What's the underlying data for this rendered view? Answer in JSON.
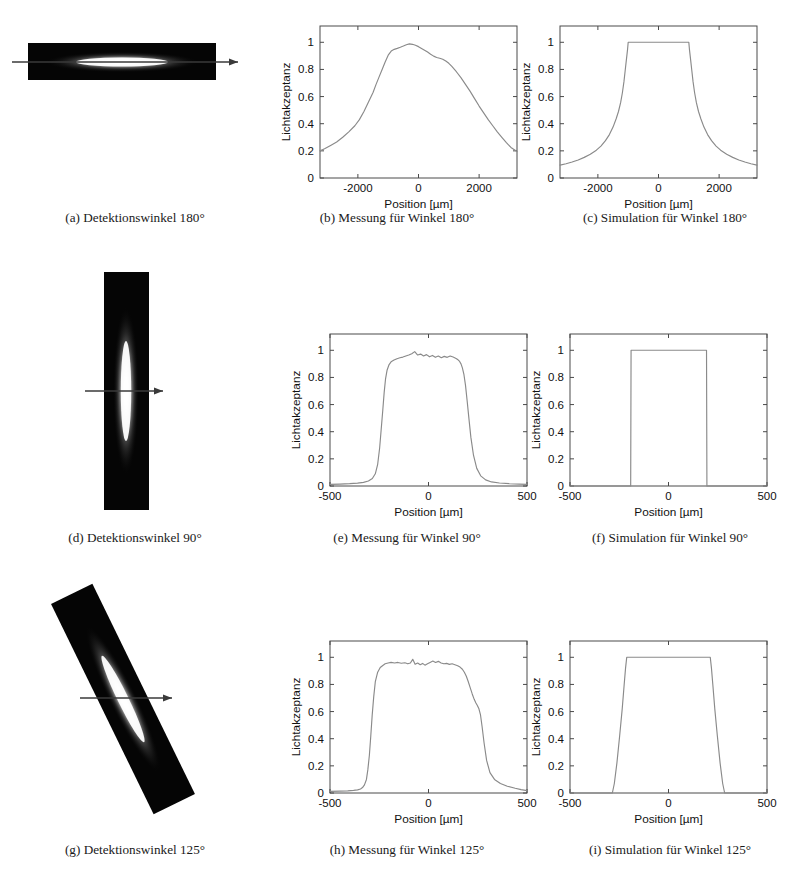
{
  "figure": {
    "rows": [
      {
        "photo": {
          "caption": "(a) Detektionswinkel 180°",
          "angle_label": "180°",
          "orientation": "horizontal",
          "rotation_deg": 0
        },
        "measurement": {
          "caption": "(b) Messung für Winkel 180°"
        },
        "simulation": {
          "caption": "(c) Simulation für Winkel 180°"
        }
      },
      {
        "photo": {
          "caption": "(d) Detektionswinkel 90°",
          "angle_label": "90°",
          "orientation": "vertical",
          "rotation_deg": 90
        },
        "measurement": {
          "caption": "(e) Messung für Winkel 90°"
        },
        "simulation": {
          "caption": "(f) Simulation für Winkel 90°"
        }
      },
      {
        "photo": {
          "caption": "(g) Detektionswinkel 125°",
          "angle_label": "125°",
          "orientation": "diagonal",
          "rotation_deg": 125
        },
        "measurement": {
          "caption": "(h) Messung für Winkel 125°"
        },
        "simulation": {
          "caption": "(i) Simulation für Winkel 125°"
        }
      }
    ]
  },
  "chart_data": [
    {
      "id": "b",
      "type": "line",
      "title": "",
      "xlabel": "Position [µm]",
      "ylabel": "Lichtakzeptanz",
      "xlim": [
        -3250,
        3250
      ],
      "ylim": [
        0,
        1.12
      ],
      "xticks": [
        -2000,
        0,
        2000
      ],
      "xticklabels": [
        "-2000",
        "0",
        "2000"
      ],
      "yticks": [
        0,
        0.2,
        0.4,
        0.6,
        0.8,
        1
      ],
      "yticklabels": [
        "0",
        "0.2",
        "0.4",
        "0.6",
        "0.8",
        "1"
      ],
      "grid": false,
      "legend": "none",
      "x": [
        -3250,
        -3100,
        -2900,
        -2700,
        -2500,
        -2300,
        -2100,
        -1950,
        -1800,
        -1650,
        -1500,
        -1400,
        -1300,
        -1200,
        -1100,
        -1000,
        -900,
        -800,
        -700,
        -600,
        -500,
        -400,
        -300,
        -200,
        -100,
        0,
        100,
        200,
        300,
        400,
        500,
        600,
        700,
        800,
        900,
        1000,
        1100,
        1250,
        1400,
        1550,
        1700,
        1850,
        2000,
        2150,
        2300,
        2450,
        2600,
        2750,
        2900,
        3050,
        3250
      ],
      "y": [
        0.2,
        0.215,
        0.24,
        0.265,
        0.3,
        0.34,
        0.385,
        0.43,
        0.49,
        0.56,
        0.63,
        0.69,
        0.745,
        0.8,
        0.855,
        0.905,
        0.935,
        0.948,
        0.955,
        0.963,
        0.972,
        0.982,
        0.988,
        0.985,
        0.978,
        0.968,
        0.955,
        0.942,
        0.928,
        0.912,
        0.898,
        0.888,
        0.882,
        0.875,
        0.862,
        0.845,
        0.822,
        0.783,
        0.74,
        0.69,
        0.64,
        0.585,
        0.53,
        0.48,
        0.43,
        0.385,
        0.34,
        0.3,
        0.26,
        0.225,
        0.195
      ]
    },
    {
      "id": "c",
      "type": "line",
      "title": "",
      "xlabel": "Position [µm]",
      "ylabel": "Lichtakzeptanz",
      "xlim": [
        -3250,
        3250
      ],
      "ylim": [
        0,
        1.12
      ],
      "xticks": [
        -2000,
        0,
        2000
      ],
      "xticklabels": [
        "-2000",
        "0",
        "2000"
      ],
      "yticks": [
        0,
        0.2,
        0.4,
        0.6,
        0.8,
        1
      ],
      "yticklabels": [
        "0",
        "0.2",
        "0.4",
        "0.6",
        "0.8",
        "1"
      ],
      "grid": false,
      "legend": "none",
      "x": [
        -3250,
        -3050,
        -2850,
        -2650,
        -2450,
        -2250,
        -2050,
        -1900,
        -1750,
        -1620,
        -1500,
        -1400,
        -1320,
        -1250,
        -1190,
        -1140,
        -1100,
        -1060,
        -1020,
        -1000,
        1000,
        1020,
        1060,
        1100,
        1140,
        1190,
        1250,
        1320,
        1400,
        1500,
        1620,
        1750,
        1900,
        2050,
        2250,
        2450,
        2650,
        2850,
        3050,
        3250
      ],
      "y": [
        0.095,
        0.105,
        0.118,
        0.133,
        0.152,
        0.175,
        0.205,
        0.235,
        0.275,
        0.32,
        0.375,
        0.435,
        0.49,
        0.555,
        0.63,
        0.71,
        0.79,
        0.87,
        0.95,
        1.0,
        1.0,
        0.95,
        0.87,
        0.79,
        0.71,
        0.63,
        0.555,
        0.49,
        0.435,
        0.375,
        0.32,
        0.275,
        0.235,
        0.205,
        0.175,
        0.152,
        0.133,
        0.118,
        0.105,
        0.095
      ]
    },
    {
      "id": "e",
      "type": "line",
      "title": "",
      "xlabel": "Position [µm]",
      "ylabel": "Lichtakzeptanz",
      "xlim": [
        -500,
        500
      ],
      "ylim": [
        0,
        1.12
      ],
      "xticks": [
        -500,
        0,
        500
      ],
      "xticklabels": [
        "-500",
        "0",
        "500"
      ],
      "yticks": [
        0,
        0.2,
        0.4,
        0.6,
        0.8,
        1
      ],
      "yticklabels": [
        "0",
        "0.2",
        "0.4",
        "0.6",
        "0.8",
        "1"
      ],
      "grid": false,
      "legend": "none",
      "x": [
        -500,
        -450,
        -400,
        -360,
        -330,
        -305,
        -285,
        -270,
        -258,
        -248,
        -240,
        -232,
        -225,
        -218,
        -210,
        -200,
        -190,
        -175,
        -160,
        -145,
        -130,
        -115,
        -100,
        -85,
        -70,
        -55,
        -40,
        -25,
        -10,
        5,
        20,
        35,
        50,
        65,
        80,
        95,
        110,
        125,
        140,
        150,
        158,
        165,
        172,
        180,
        188,
        196,
        205,
        215,
        228,
        245,
        265,
        290,
        320,
        360,
        410,
        460,
        500
      ],
      "y": [
        0.012,
        0.014,
        0.017,
        0.021,
        0.027,
        0.037,
        0.055,
        0.09,
        0.16,
        0.28,
        0.42,
        0.56,
        0.69,
        0.79,
        0.855,
        0.895,
        0.915,
        0.928,
        0.938,
        0.945,
        0.95,
        0.958,
        0.965,
        0.975,
        0.99,
        0.965,
        0.972,
        0.958,
        0.968,
        0.952,
        0.962,
        0.948,
        0.958,
        0.945,
        0.955,
        0.948,
        0.958,
        0.95,
        0.94,
        0.93,
        0.918,
        0.9,
        0.87,
        0.82,
        0.74,
        0.63,
        0.5,
        0.36,
        0.23,
        0.13,
        0.075,
        0.045,
        0.03,
        0.022,
        0.017,
        0.014,
        0.012
      ]
    },
    {
      "id": "f",
      "type": "line",
      "title": "",
      "xlabel": "Position [µm]",
      "ylabel": "Lichtakzeptanz",
      "xlim": [
        -500,
        500
      ],
      "ylim": [
        0,
        1.12
      ],
      "xticks": [
        -500,
        0,
        500
      ],
      "xticklabels": [
        "-500",
        "0",
        "500"
      ],
      "yticks": [
        0,
        0.2,
        0.4,
        0.6,
        0.8,
        1
      ],
      "yticklabels": [
        "0",
        "0.2",
        "0.4",
        "0.6",
        "0.8",
        "1"
      ],
      "grid": false,
      "legend": "none",
      "x": [
        -500,
        -192,
        -190,
        193,
        195,
        500
      ],
      "y": [
        0.0,
        0.0,
        1.0,
        1.0,
        0.0,
        0.0
      ]
    },
    {
      "id": "h",
      "type": "line",
      "title": "",
      "xlabel": "Position [µm]",
      "ylabel": "Lichtakzeptanz",
      "xlim": [
        -500,
        500
      ],
      "ylim": [
        0,
        1.12
      ],
      "xticks": [
        -500,
        0,
        500
      ],
      "xticklabels": [
        "-500",
        "0",
        "500"
      ],
      "yticks": [
        0,
        0.2,
        0.4,
        0.6,
        0.8,
        1
      ],
      "yticklabels": [
        "0",
        "0.2",
        "0.4",
        "0.6",
        "0.8",
        "1"
      ],
      "grid": false,
      "legend": "none",
      "x": [
        -500,
        -450,
        -410,
        -380,
        -360,
        -345,
        -335,
        -325,
        -315,
        -308,
        -300,
        -293,
        -286,
        -278,
        -270,
        -258,
        -245,
        -232,
        -220,
        -205,
        -190,
        -172,
        -155,
        -138,
        -120,
        -105,
        -92,
        -80,
        -68,
        -55,
        -42,
        -30,
        -18,
        -5,
        8,
        22,
        36,
        50,
        64,
        78,
        92,
        106,
        120,
        134,
        148,
        160,
        172,
        182,
        192,
        202,
        212,
        222,
        232,
        240,
        248,
        256,
        264,
        272,
        282,
        295,
        312,
        335,
        365,
        400,
        440,
        470,
        500
      ],
      "y": [
        0.012,
        0.014,
        0.016,
        0.019,
        0.023,
        0.03,
        0.04,
        0.06,
        0.1,
        0.17,
        0.28,
        0.42,
        0.57,
        0.71,
        0.82,
        0.89,
        0.925,
        0.94,
        0.952,
        0.958,
        0.962,
        0.958,
        0.962,
        0.956,
        0.96,
        0.952,
        0.958,
        0.985,
        0.948,
        0.958,
        0.945,
        0.955,
        0.942,
        0.952,
        0.962,
        0.972,
        0.962,
        0.97,
        0.958,
        0.952,
        0.955,
        0.948,
        0.952,
        0.945,
        0.938,
        0.928,
        0.912,
        0.89,
        0.86,
        0.82,
        0.775,
        0.73,
        0.69,
        0.665,
        0.645,
        0.62,
        0.575,
        0.49,
        0.37,
        0.24,
        0.15,
        0.1,
        0.07,
        0.05,
        0.035,
        0.025,
        0.018
      ]
    },
    {
      "id": "i",
      "type": "line",
      "title": "",
      "xlabel": "Position [µm]",
      "ylabel": "Lichtakzeptanz",
      "xlim": [
        -500,
        500
      ],
      "ylim": [
        0,
        1.12
      ],
      "xticks": [
        -500,
        0,
        500
      ],
      "xticklabels": [
        "-500",
        "0",
        "500"
      ],
      "yticks": [
        0,
        0.2,
        0.4,
        0.6,
        0.8,
        1
      ],
      "yticklabels": [
        "0",
        "0.2",
        "0.4",
        "0.6",
        "0.8",
        "1"
      ],
      "grid": false,
      "legend": "none",
      "x": [
        -500,
        -285,
        -275,
        -262,
        -248,
        -235,
        -225,
        -218,
        -212,
        212,
        218,
        225,
        235,
        248,
        262,
        275,
        285,
        500
      ],
      "y": [
        0.0,
        0.0,
        0.07,
        0.22,
        0.42,
        0.62,
        0.8,
        0.92,
        1.0,
        1.0,
        0.92,
        0.8,
        0.62,
        0.42,
        0.22,
        0.07,
        0.0,
        0.0
      ]
    }
  ]
}
